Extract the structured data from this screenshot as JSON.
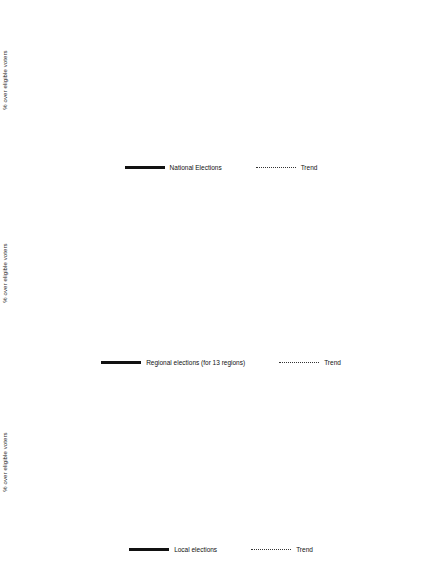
{
  "axis": {
    "ylabel": "% over eligible voters"
  },
  "charts": [
    {
      "id": "national",
      "series_name": "National Elections",
      "trend_name": "Trend",
      "chart_data": {
        "type": "line",
        "title": "",
        "xlabel": "",
        "ylabel": "% over eligible voters",
        "ylim": [
          50,
          85
        ],
        "ytick_step": 5,
        "yticks": [
          50,
          55,
          60,
          65,
          70,
          75,
          80,
          85
        ],
        "grid": true,
        "legend": "bottom",
        "categories": [
          "1977",
          "1979",
          "1982",
          "1983",
          "1986",
          "1987",
          "1989",
          "1991",
          "1993",
          "1995",
          "1996",
          "1999",
          "2000",
          "2003",
          "2004",
          "2005",
          "2006",
          "2007",
          "2008"
        ],
        "series": [
          {
            "name": "National Elections",
            "style": "solid",
            "points": [
              {
                "x": "1977",
                "y": 79,
                "label": "79"
              },
              {
                "x": "1979",
                "y": 68,
                "label": "68"
              },
              {
                "x": "1982",
                "y": 80,
                "label": "80"
              },
              {
                "x": "1986",
                "y": 71,
                "label": "71"
              },
              {
                "x": "1989",
                "y": 70,
                "label": "70"
              },
              {
                "x": "1993",
                "y": 76,
                "label": "76"
              },
              {
                "x": "1996",
                "y": 77,
                "label": "77"
              },
              {
                "x": "2000",
                "y": 69,
                "label": "69"
              },
              {
                "x": "2004",
                "y": 76,
                "label": "76"
              },
              {
                "x": "2008",
                "y": 74,
                "label": "74"
              }
            ]
          },
          {
            "name": "Trend",
            "style": "dotted",
            "points": [
              {
                "x": "1977",
                "y": 74.9
              },
              {
                "x": "2008",
                "y": 74.0
              }
            ]
          }
        ]
      }
    },
    {
      "id": "regional",
      "series_name": "Regional elections (for 13 regions)",
      "trend_name": "Trend",
      "chart_data": {
        "type": "line",
        "title": "",
        "xlabel": "",
        "ylabel": "% over eligible voters",
        "ylim": [
          50,
          90
        ],
        "ytick_step": 5,
        "yticks": [
          50,
          55,
          60,
          65,
          70,
          75,
          80,
          85,
          90
        ],
        "grid": true,
        "legend": "bottom",
        "categories": [
          "1977",
          "1979",
          "1982",
          "1983",
          "1986",
          "1987",
          "1989",
          "1991",
          "1993",
          "1995",
          "1996",
          "1999",
          "2000",
          "2003",
          "2004",
          "2005",
          "2006",
          "2007",
          "2008"
        ],
        "series": [
          {
            "name": "Regional elections (for 13 regions)",
            "style": "solid",
            "points": [
              {
                "x": "1983",
                "y": 69,
                "label": "69"
              },
              {
                "x": "1987",
                "y": 72,
                "label": "72"
              },
              {
                "x": "1991",
                "y": 66,
                "label": "66"
              },
              {
                "x": "1995",
                "y": 72,
                "label": "72"
              },
              {
                "x": "1999",
                "y": 67,
                "label": "67"
              },
              {
                "x": "2003",
                "y": 66,
                "label": "66"
              },
              {
                "x": "2007",
                "y": 64,
                "label": "64"
              }
            ]
          },
          {
            "name": "Trend",
            "style": "dotted",
            "points": [
              {
                "x": "1977",
                "y": 68.6
              },
              {
                "x": "2008",
                "y": 65.0
              }
            ]
          }
        ]
      }
    },
    {
      "id": "local",
      "series_name": "Local elections",
      "trend_name": "Trend",
      "chart_data": {
        "type": "line",
        "title": "",
        "xlabel": "",
        "ylabel": "% over eligible voters",
        "ylim": [
          50,
          85
        ],
        "ytick_step": 5,
        "yticks": [
          50,
          55,
          60,
          65,
          70,
          75,
          80,
          85
        ],
        "grid": true,
        "legend": "bottom",
        "categories": [
          "1977",
          "1979",
          "1982",
          "1983",
          "1986",
          "1987",
          "1989",
          "1991",
          "1993",
          "1995",
          "1996",
          "1999",
          "2000",
          "2003",
          "2004",
          "2005",
          "2006",
          "2007"
        ],
        "series": [
          {
            "name": "Local elections",
            "style": "solid",
            "points": [
              {
                "x": "1979",
                "y": 63,
                "label": "63"
              },
              {
                "x": "1983",
                "y": 68,
                "label": "68"
              },
              {
                "x": "1987",
                "y": 69,
                "label": "69"
              },
              {
                "x": "1991",
                "y": 63,
                "label": "63"
              },
              {
                "x": "1995",
                "y": 70,
                "label": "70"
              },
              {
                "x": "1999",
                "y": 64,
                "label": "64"
              },
              {
                "x": "2003",
                "y": 67,
                "label": "67"
              },
              {
                "x": "2007",
                "y": 63,
                "label": "63"
              }
            ]
          },
          {
            "name": "Trend",
            "style": "dotted",
            "points": [
              {
                "x": "1977",
                "y": 64.0
              },
              {
                "x": "2007",
                "y": 65.6
              }
            ]
          }
        ]
      }
    }
  ],
  "colors": {
    "line": "#111111",
    "trend": "#3a3a3a",
    "grid": "#a9a9a9",
    "axis": "#8c8c8c",
    "text": "#1a1a1a"
  }
}
